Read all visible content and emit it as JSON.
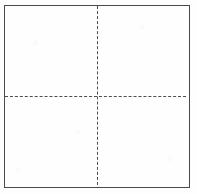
{
  "figure": {
    "name": "square-divided-into-four-quadrants",
    "background_color": "#fefefe",
    "outline": {
      "name": "outer-square",
      "style": "solid",
      "color": "#4a4a4a",
      "thickness_px": 1.4,
      "x_px": 4,
      "y_px": 5,
      "width_px": 186,
      "height_px": 183
    },
    "dividers": [
      {
        "name": "vertical-dashed-line",
        "orientation": "vertical",
        "style": "dashed",
        "color": "#4d4d4d",
        "thickness_px": 1.6,
        "position_px": 97
      },
      {
        "name": "horizontal-dashed-line",
        "orientation": "horizontal",
        "style": "dashed",
        "color": "#4d4d4d",
        "thickness_px": 1.6,
        "position_px": 96
      }
    ],
    "intersection": {
      "name": "center-point",
      "x_px": 97,
      "y_px": 96
    },
    "quadrants": [
      {
        "name": "quadrant-top-left",
        "label": ""
      },
      {
        "name": "quadrant-top-right",
        "label": ""
      },
      {
        "name": "quadrant-bottom-left",
        "label": ""
      },
      {
        "name": "quadrant-bottom-right",
        "label": ""
      }
    ]
  },
  "canvas": {
    "width_px": 197,
    "height_px": 194
  }
}
